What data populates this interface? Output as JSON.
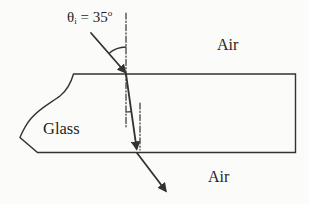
{
  "figure": {
    "type": "refraction-through-glass-slab",
    "angle_label": {
      "symbol": "θ",
      "subscript": "i",
      "equals_value": "= 35",
      "degree": "o"
    },
    "incident_angle_degrees": 35,
    "labels": {
      "air_top": "Air",
      "glass": "Glass",
      "air_bottom": "Air"
    },
    "colors": {
      "stroke": "#333333",
      "text": "#1f1f1f",
      "background": "#fbfbf9"
    }
  }
}
